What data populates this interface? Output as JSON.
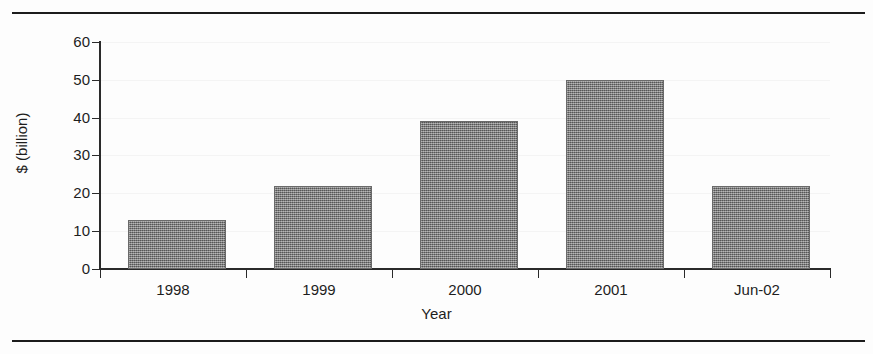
{
  "figure": {
    "top_rule": "",
    "bottom_rule": ""
  },
  "chart_data": {
    "type": "bar",
    "title": "",
    "categories": [
      "1998",
      "1999",
      "2000",
      "2001",
      "Jun-02"
    ],
    "values": [
      13,
      22,
      39,
      50,
      22
    ],
    "series": [
      {
        "name": "$ (billion)",
        "values": [
          13,
          22,
          39,
          50,
          22
        ]
      }
    ],
    "xlabel": "Year",
    "ylabel": "$ (billion)",
    "ylim": [
      0,
      60
    ],
    "ytick_labels": [
      "60",
      "50",
      "40",
      "30",
      "20",
      "10",
      "0"
    ],
    "ytick_values": [
      60,
      50,
      40,
      30,
      20,
      10,
      0
    ],
    "ytick_interval": 10,
    "grid": "horizontal-faint",
    "legend": "none",
    "legend_position": "none",
    "bar_color": "#7a7a7a",
    "bar_fill": "dithered-gray-halftone",
    "axis_color": "#2a2a2a",
    "annotations": []
  }
}
